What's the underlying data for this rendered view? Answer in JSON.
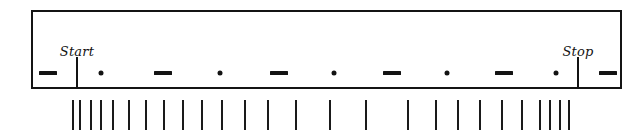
{
  "figure": {
    "type": "timing-diagram",
    "background_color": "#ffffff",
    "ink_color": "#131313"
  },
  "scale_bar": {
    "name": "signal-bar",
    "x": 31,
    "y": 10,
    "width": 591,
    "height": 79,
    "border_width": 2,
    "border_color": "#141414",
    "fill_color": "#ffffff"
  },
  "marks": [
    {
      "label": "dash-1",
      "type": "dash",
      "x": 48,
      "y": 73
    },
    {
      "label": "dot-1",
      "type": "dot",
      "x": 101,
      "y": 73
    },
    {
      "label": "dash-2",
      "type": "dash",
      "x": 163,
      "y": 73
    },
    {
      "label": "dot-2",
      "type": "dot",
      "x": 220,
      "y": 73
    },
    {
      "label": "dash-3",
      "type": "dash",
      "x": 279,
      "y": 73
    },
    {
      "label": "dot-3",
      "type": "dot",
      "x": 334,
      "y": 73
    },
    {
      "label": "dash-4",
      "type": "dash",
      "x": 392,
      "y": 73
    },
    {
      "label": "dot-4",
      "type": "dot",
      "x": 447,
      "y": 73
    },
    {
      "label": "dash-5",
      "type": "dash",
      "x": 504,
      "y": 73
    },
    {
      "label": "dot-5",
      "type": "dot",
      "x": 556,
      "y": 73
    },
    {
      "label": "dash-6",
      "type": "dash",
      "x": 608,
      "y": 73
    }
  ],
  "events": [
    {
      "id": "start",
      "label": "Start",
      "x": 77,
      "label_y": 45,
      "line_top": 57,
      "line_height": 32
    },
    {
      "id": "stop",
      "label": "Stop",
      "x": 578,
      "label_y": 45,
      "line_top": 57,
      "line_height": 32
    }
  ],
  "ticks": {
    "top": 100,
    "height": 30,
    "positions": [
      73,
      80,
      91,
      101,
      113,
      129,
      146,
      164,
      183,
      202,
      222,
      245,
      268,
      296,
      330,
      366,
      408,
      436,
      458,
      480,
      502,
      522,
      540,
      550,
      560,
      569
    ],
    "count": 26
  }
}
